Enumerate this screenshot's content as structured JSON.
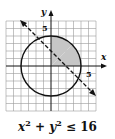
{
  "diagram": {
    "x_label": "x",
    "y_label": "y",
    "x_tick_label": "5",
    "y_tick_label": "5",
    "circle": {
      "center": [
        0,
        0
      ],
      "radius": 4
    },
    "boundary_line": {
      "style": "dashed",
      "through": [
        [
          -5,
          5
        ],
        [
          5,
          -5
        ]
      ]
    },
    "shaded_region": "inside circle, above line y = -x, x ≥ 0",
    "shade_color": "#c8c8c8"
  },
  "caption": {
    "x": "x",
    "x_exp": "2",
    "plus": " + ",
    "y": "y",
    "y_exp": "2",
    "rel": " ≤ 16"
  }
}
